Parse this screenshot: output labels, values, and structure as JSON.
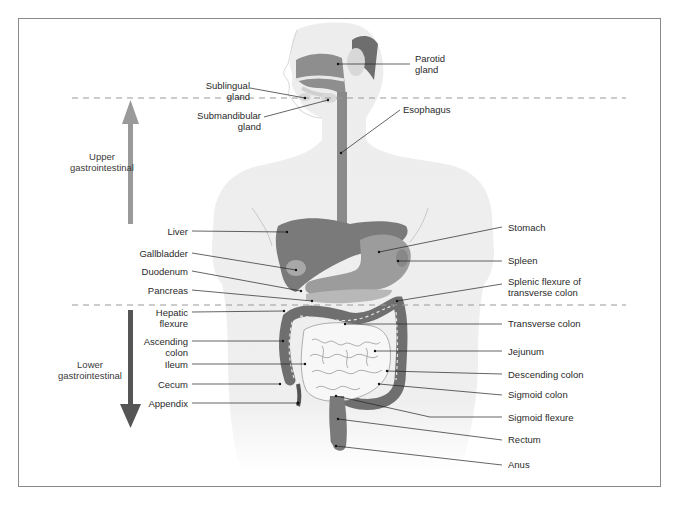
{
  "diagram": {
    "colors": {
      "frame": "#8a8a8a",
      "body": "#ececec",
      "organ_dark": "#7a7a7a",
      "organ_mid": "#9a9a9a",
      "organ_light": "#b5b5b5",
      "intestine": "#f4f4f4",
      "dashed_line": "#999999",
      "upper_arrow": "#9a9a9a",
      "lower_arrow": "#555555",
      "leader": "#222222"
    },
    "regions": {
      "upper": {
        "label": "Upper\ngastrointestinal",
        "arrow": "arrow-up"
      },
      "lower": {
        "label": "Lower\ngastrointestinal",
        "arrow": "arrow-down"
      }
    },
    "labels_left": [
      {
        "id": "sublingual-gland",
        "text": "Sublingual\ngland"
      },
      {
        "id": "submandibular-gland",
        "text": "Submandibular\ngland"
      },
      {
        "id": "liver",
        "text": "Liver"
      },
      {
        "id": "gallbladder",
        "text": "Gallbladder"
      },
      {
        "id": "duodenum",
        "text": "Duodenum"
      },
      {
        "id": "pancreas",
        "text": "Pancreas"
      },
      {
        "id": "hepatic-flexure",
        "text": "Hepatic\nflexure"
      },
      {
        "id": "ascending-colon",
        "text": "Ascending\ncolon"
      },
      {
        "id": "ileum",
        "text": "Ileum"
      },
      {
        "id": "cecum",
        "text": "Cecum"
      },
      {
        "id": "appendix",
        "text": "Appendix"
      }
    ],
    "labels_right": [
      {
        "id": "parotid-gland",
        "text": "Parotid\ngland"
      },
      {
        "id": "esophagus",
        "text": "Esophagus"
      },
      {
        "id": "stomach",
        "text": "Stomach"
      },
      {
        "id": "spleen",
        "text": "Spleen"
      },
      {
        "id": "splenic-flexure",
        "text": "Splenic flexure of\ntransverse colon"
      },
      {
        "id": "transverse-colon",
        "text": "Transverse colon"
      },
      {
        "id": "jejunum",
        "text": "Jejunum"
      },
      {
        "id": "descending-colon",
        "text": "Descending colon"
      },
      {
        "id": "sigmoid-colon",
        "text": "Sigmoid colon"
      },
      {
        "id": "sigmoid-flexure",
        "text": "Sigmoid flexure"
      },
      {
        "id": "rectum",
        "text": "Rectum"
      },
      {
        "id": "anus",
        "text": "Anus"
      }
    ]
  }
}
